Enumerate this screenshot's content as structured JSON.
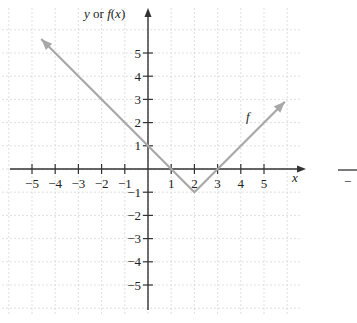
{
  "chart_data": {
    "type": "line",
    "title": "",
    "xlabel": "x",
    "ylabel": "y or f(x)",
    "function_label": "f",
    "xlim": [
      -5.5,
      6.2
    ],
    "ylim": [
      -6.2,
      6.8
    ],
    "x_ticks": [
      -5,
      -4,
      -3,
      -2,
      -1,
      1,
      2,
      3,
      4,
      5
    ],
    "y_ticks": [
      -5,
      -4,
      -3,
      -2,
      -1,
      1,
      2,
      3,
      4,
      5
    ],
    "x_tick_labels": [
      "−5",
      "−4",
      "−3",
      "−2",
      "−1",
      "1",
      "2",
      "3",
      "4",
      "5"
    ],
    "y_tick_labels": [
      "−5",
      "−4",
      "−3",
      "−2",
      "−1",
      "1",
      "2",
      "3",
      "4",
      "5"
    ],
    "grid": true,
    "series": [
      {
        "name": "f",
        "description": "f(x) = |x − 2| − 1, drawn with arrows at both ends",
        "points": [
          {
            "x": -4.6,
            "y": 5.6
          },
          {
            "x": 0,
            "y": 1
          },
          {
            "x": 1,
            "y": 0
          },
          {
            "x": 2,
            "y": -1
          },
          {
            "x": 3,
            "y": 0
          },
          {
            "x": 5.9,
            "y": 2.9
          }
        ],
        "color": "#a8a8a8"
      }
    ],
    "axis_color": "#333333",
    "grid_color": "#d8d8d8"
  },
  "labels": {
    "y_axis": "y or f(x)",
    "x_axis": "x",
    "curve": "f",
    "neighbor_fragment": "−"
  }
}
